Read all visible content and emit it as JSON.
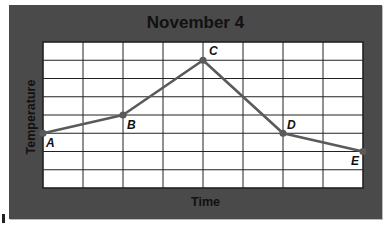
{
  "chart_data": {
    "type": "line",
    "title": "November 4",
    "xlabel": "Time",
    "ylabel": "Temperature",
    "grid": true,
    "grid_columns": 8,
    "grid_rows": 8,
    "xlim": [
      0,
      8
    ],
    "ylim": [
      0,
      8
    ],
    "x_tick_labels": [],
    "y_tick_labels": [],
    "series": [
      {
        "name": "Temperature",
        "points": [
          {
            "label": "A",
            "x": 0,
            "y": 3
          },
          {
            "label": "B",
            "x": 2,
            "y": 4
          },
          {
            "label": "C",
            "x": 4,
            "y": 7
          },
          {
            "label": "D",
            "x": 6,
            "y": 3
          },
          {
            "label": "E",
            "x": 8,
            "y": 2
          }
        ]
      }
    ],
    "colors": {
      "panel": "#4a4a4a",
      "plot_bg": "#ffffff",
      "grid": "#222222",
      "line": "#5a5a5a"
    }
  }
}
